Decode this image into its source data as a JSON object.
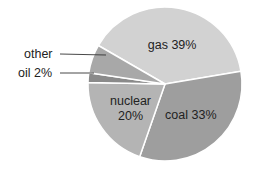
{
  "chart_data": {
    "type": "pie",
    "title": "",
    "start_angle_deg": -60,
    "direction": "clockwise",
    "slices": [
      {
        "label": "gas",
        "value": 39,
        "display": "gas 39%",
        "color": "#d2d2d2",
        "label_mode": "inside"
      },
      {
        "label": "coal",
        "value": 33,
        "display": "coal 33%",
        "color": "#9e9e9e",
        "label_mode": "inside"
      },
      {
        "label": "nuclear",
        "value": 20,
        "display_lines": [
          "nuclear",
          "20%"
        ],
        "color": "#b4b4b4",
        "label_mode": "inside"
      },
      {
        "label": "oil",
        "value": 2,
        "display": "oil 2%",
        "color": "#8a8a8a",
        "label_mode": "leader"
      },
      {
        "label": "other",
        "value": 6,
        "display": "other",
        "color": "#a8a8a8",
        "label_mode": "leader"
      }
    ],
    "separator_color": "#ffffff",
    "leader_color": "#333333"
  }
}
